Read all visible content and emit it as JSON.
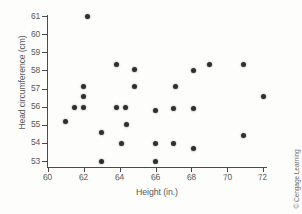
{
  "figure": {
    "credit": "© Cengage Learning"
  },
  "chart_data": {
    "type": "scatter",
    "title": "",
    "xlabel": "Height (in.)",
    "ylabel": "Head circumference (cm)",
    "xlim": [
      59.3,
      72.4
    ],
    "ylim": [
      52.6,
      61.3
    ],
    "xticks": [
      60,
      62,
      64,
      66,
      68,
      70,
      72
    ],
    "yticks": [
      53,
      54,
      55,
      56,
      57,
      58,
      59,
      60,
      61
    ],
    "xtick_labels": [
      "60",
      "62",
      "64",
      "66",
      "68",
      "70",
      "72"
    ],
    "ytick_labels": [
      "53",
      "54",
      "55",
      "56",
      "57",
      "58",
      "59",
      "60",
      "61"
    ],
    "grid": false,
    "legend": null,
    "marker": "filled-circle",
    "marker_color": "#2f2f2f",
    "points": [
      {
        "x": 62.2,
        "y": 60.95
      },
      {
        "x": 63.8,
        "y": 58.3
      },
      {
        "x": 64.8,
        "y": 58.05
      },
      {
        "x": 68.1,
        "y": 58.0
      },
      {
        "x": 69.0,
        "y": 58.3
      },
      {
        "x": 70.9,
        "y": 58.3
      },
      {
        "x": 62.0,
        "y": 57.1
      },
      {
        "x": 64.8,
        "y": 57.1
      },
      {
        "x": 67.1,
        "y": 57.1
      },
      {
        "x": 62.0,
        "y": 56.55
      },
      {
        "x": 72.0,
        "y": 56.55
      },
      {
        "x": 61.5,
        "y": 55.95
      },
      {
        "x": 62.0,
        "y": 55.95
      },
      {
        "x": 63.8,
        "y": 55.95
      },
      {
        "x": 64.35,
        "y": 55.95
      },
      {
        "x": 67.0,
        "y": 55.92
      },
      {
        "x": 68.1,
        "y": 55.92
      },
      {
        "x": 66.0,
        "y": 55.8
      },
      {
        "x": 61.0,
        "y": 55.2
      },
      {
        "x": 64.4,
        "y": 55.0
      },
      {
        "x": 63.0,
        "y": 54.6
      },
      {
        "x": 70.9,
        "y": 54.4
      },
      {
        "x": 64.1,
        "y": 53.95
      },
      {
        "x": 66.0,
        "y": 53.95
      },
      {
        "x": 67.0,
        "y": 53.95
      },
      {
        "x": 68.1,
        "y": 53.68
      },
      {
        "x": 63.0,
        "y": 53.0
      },
      {
        "x": 66.0,
        "y": 53.0
      }
    ]
  }
}
